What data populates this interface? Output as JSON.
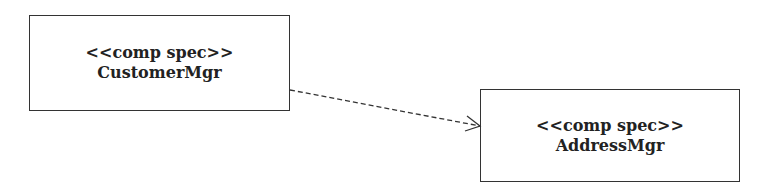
{
  "diagram": {
    "type": "uml-component-dependency",
    "nodes": [
      {
        "id": "customer-mgr",
        "stereotype": "<<comp spec>>",
        "name": "CustomerMgr"
      },
      {
        "id": "address-mgr",
        "stereotype": "<<comp spec>>",
        "name": "AddressMgr"
      }
    ],
    "edges": [
      {
        "from": "customer-mgr",
        "to": "address-mgr",
        "style": "dashed",
        "arrow": "open"
      }
    ]
  },
  "colors": {
    "stroke": "#333333",
    "text": "#222222",
    "background": "#ffffff"
  }
}
